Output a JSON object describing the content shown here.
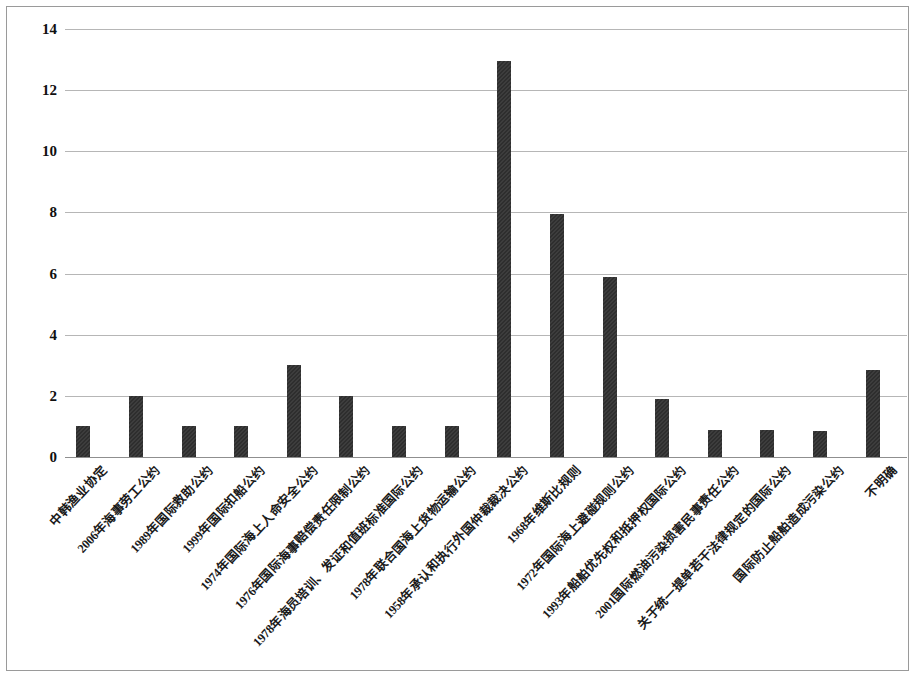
{
  "chart_data": {
    "type": "bar",
    "title": "",
    "subtitle": "",
    "xlabel": "",
    "ylabel": "",
    "ylim": [
      0,
      14
    ],
    "ytick_values": [
      14,
      12,
      10,
      8,
      6,
      4,
      2,
      0
    ],
    "ytick_labels": [
      "14",
      "12",
      "10",
      "8",
      "6",
      "4",
      "2",
      "0"
    ],
    "grid": true,
    "legend": "none",
    "bar_color": "#2e2e2e",
    "categories": [
      "中韩渔业协定",
      "2006年海事劳工公约",
      "1989年国际救助公约",
      "1999年国际扣船公约",
      "1974年国际海上人命安全公约",
      "1976年国际海事赔偿责任限制公约",
      "1978年海员培训、发证和值班标准国际公约",
      "1978年联合国海上货物运输公约",
      "1958年承认和执行外国仲裁裁决公约",
      "1968年维斯比规则",
      "1972年国际海上避碰规则公约",
      "1993年船舶优先权和抵押权国际公约",
      "2001国际燃油污染损害民事责任公约",
      "关于统一提单若干法律规定的国际公约",
      "国际防止船舶造成污染公约",
      "不明确"
    ],
    "values": [
      1,
      2,
      1,
      1,
      3,
      2,
      1,
      1,
      12.95,
      7.95,
      5.9,
      1.9,
      0.9,
      0.9,
      0.85,
      2.85
    ]
  }
}
